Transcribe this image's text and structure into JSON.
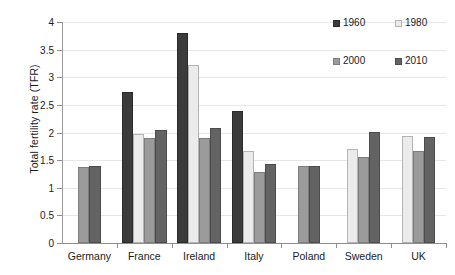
{
  "chart_data": {
    "type": "bar",
    "title": "",
    "xlabel": "",
    "ylabel": "Total fertility rate (TFR)",
    "ylim": [
      0,
      4
    ],
    "yticks": [
      "0",
      "0.5",
      "1",
      "1.5",
      "2",
      "2.5",
      "3",
      "3.5",
      "4"
    ],
    "ytick_values": [
      0,
      0.5,
      1,
      1.5,
      2,
      2.5,
      3,
      3.5,
      4
    ],
    "grid": true,
    "legend_position": "top-right",
    "categories": [
      "Germany",
      "France",
      "Ireland",
      "Italy",
      "Poland",
      "Sweden",
      "UK"
    ],
    "series": [
      {
        "name": "1960",
        "color": "#3b3b3b",
        "values": [
          null,
          2.74,
          3.8,
          2.39,
          null,
          null,
          null
        ]
      },
      {
        "name": "1980",
        "color": "#ebebeb",
        "values": [
          null,
          1.97,
          3.22,
          1.66,
          null,
          1.7,
          1.93
        ]
      },
      {
        "name": "2000",
        "color": "#9b9b9b",
        "values": [
          1.38,
          1.9,
          1.9,
          1.28,
          1.39,
          1.56,
          1.66
        ]
      },
      {
        "name": "2010",
        "color": "#636363",
        "values": [
          1.39,
          2.04,
          2.08,
          1.43,
          1.4,
          2.01,
          1.92
        ]
      }
    ]
  },
  "legend": {
    "items": [
      {
        "label": "1960"
      },
      {
        "label": "1980"
      },
      {
        "label": "2000"
      },
      {
        "label": "2010"
      }
    ]
  },
  "axes": {
    "y_title": "Total fertility rate (TFR)"
  }
}
